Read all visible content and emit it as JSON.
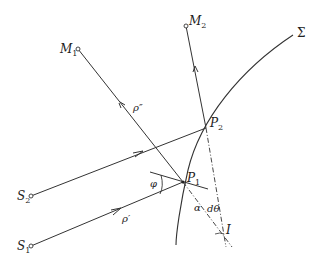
{
  "diagram": {
    "type": "optics-ray-geometry",
    "points": {
      "M1": {
        "label": "M",
        "sub": "1",
        "x": 78,
        "y": 49
      },
      "M2": {
        "label": "M",
        "sub": "2",
        "x": 186,
        "y": 26
      },
      "S1": {
        "label": "S",
        "sub": "1",
        "x": 31,
        "y": 246
      },
      "S2": {
        "label": "S",
        "sub": "2",
        "x": 31,
        "y": 196
      },
      "P1": {
        "label": "P",
        "sub": "1",
        "x": 183,
        "y": 182
      },
      "P2": {
        "label": "P",
        "sub": "2",
        "x": 206,
        "y": 128
      },
      "I": {
        "label": "I",
        "x": 225,
        "y": 243
      }
    },
    "surface": {
      "label": "Σ"
    },
    "labels": {
      "rho_double_prime": "ρ″",
      "rho_prime": "ρ′",
      "phi": "φ",
      "alpha": "α",
      "d_theta": "dθ"
    },
    "colors": {
      "line": "#333333",
      "background": "#ffffff"
    }
  }
}
